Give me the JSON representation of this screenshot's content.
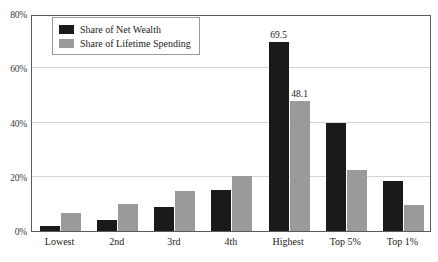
{
  "chart_data": {
    "type": "bar",
    "title": "",
    "xlabel": "",
    "ylabel": "",
    "ylim": [
      0,
      80
    ],
    "grid": true,
    "legend_position": "top-left",
    "categories": [
      "Lowest",
      "2nd",
      "3rd",
      "4th",
      "Highest",
      "Top 5%",
      "Top 1%"
    ],
    "ytick_labels": [
      "0%",
      "20%",
      "40%",
      "60%",
      "80%"
    ],
    "ytick_values": [
      0,
      20,
      40,
      60,
      80
    ],
    "series": [
      {
        "name": "Share of Net Wealth",
        "color": "#1a1a1a",
        "values": [
          2.0,
          4.0,
          8.7,
          15.0,
          69.5,
          40.0,
          18.5
        ],
        "labels": [
          "",
          "",
          "",
          "",
          "69.5",
          "",
          ""
        ]
      },
      {
        "name": "Share of Lifetime Spending",
        "color": "#9a9a9a",
        "values": [
          6.7,
          10.0,
          14.8,
          20.3,
          48.1,
          22.5,
          9.5
        ],
        "labels": [
          "",
          "",
          "",
          "",
          "48.1",
          "",
          ""
        ]
      }
    ],
    "annotations": [
      "69.5",
      "48.1"
    ]
  },
  "legend": {
    "items": [
      {
        "label": "Share of Net Wealth",
        "swatch": "dark"
      },
      {
        "label": "Share of Lifetime Spending",
        "swatch": "gray"
      }
    ]
  },
  "title_sliver": {
    "text": ""
  }
}
